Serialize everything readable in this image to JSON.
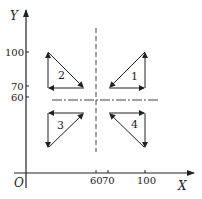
{
  "diagram": {
    "axes": {
      "x_label": "X",
      "y_label": "Y",
      "origin_label": "O",
      "x_ticks": [
        "60",
        "70",
        "100"
      ],
      "y_ticks": [
        "100",
        "70",
        "60"
      ]
    },
    "reference_lines": {
      "vertical_at_x": 60,
      "horizontal_at_y": 60
    },
    "triangles": [
      {
        "label": "1",
        "quadrant": "upper-right",
        "cycle": "counterclockwise"
      },
      {
        "label": "2",
        "quadrant": "upper-left",
        "cycle": "counterclockwise"
      },
      {
        "label": "3",
        "quadrant": "lower-left",
        "cycle": "counterclockwise"
      },
      {
        "label": "4",
        "quadrant": "lower-right",
        "cycle": "clockwise"
      }
    ],
    "colors": {
      "ink": "#222222",
      "background": "#ffffff"
    }
  }
}
